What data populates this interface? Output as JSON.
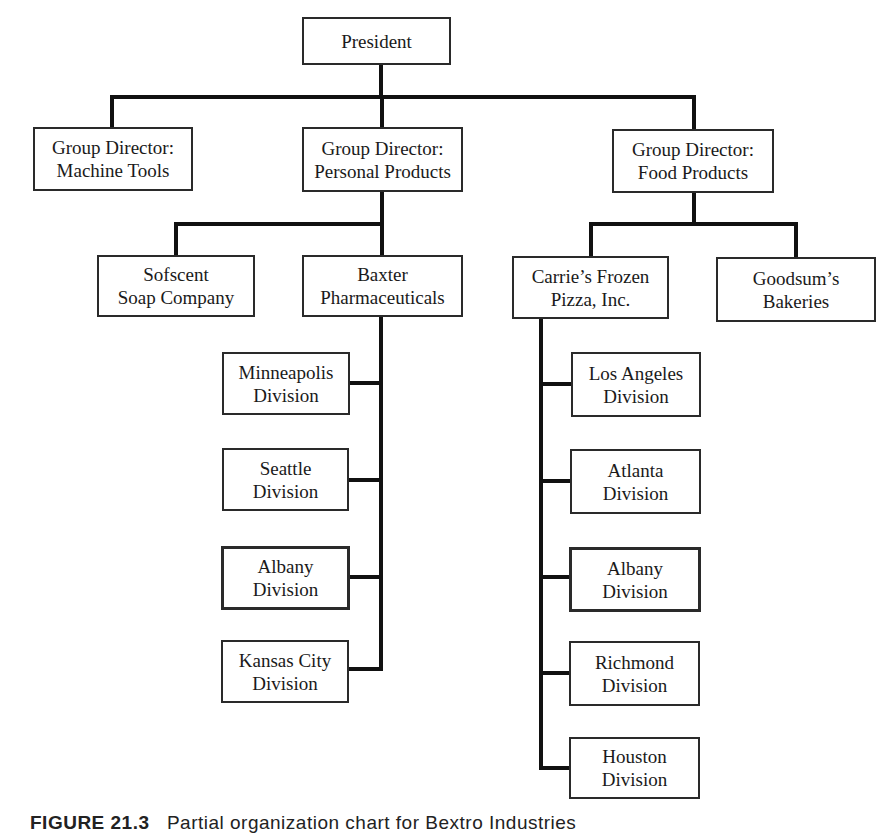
{
  "diagram": {
    "type": "organization-chart",
    "nodes": {
      "president": "President",
      "machine_tools": "Group Director:\nMachine Tools",
      "personal_products": "Group Director:\nPersonal Products",
      "food_products": "Group Director:\nFood Products",
      "sofscent": "Sofscent\nSoap Company",
      "baxter": "Baxter\nPharmaceuticals",
      "carries": "Carrie’s Frozen\nPizza, Inc.",
      "goodsums": "Goodsum’s\nBakeries",
      "baxter_divisions": [
        {
          "label": "Minneapolis\nDivision",
          "highlight": false
        },
        {
          "label": "Seattle\nDivision",
          "highlight": false
        },
        {
          "label": "Albany\nDivision",
          "highlight": true
        },
        {
          "label": "Kansas City\nDivision",
          "highlight": false
        }
      ],
      "carries_divisions": [
        {
          "label": "Los Angeles\nDivision",
          "highlight": false
        },
        {
          "label": "Atlanta\nDivision",
          "highlight": false
        },
        {
          "label": "Albany\nDivision",
          "highlight": true
        },
        {
          "label": "Richmond\nDivision",
          "highlight": false
        },
        {
          "label": "Houston\nDivision",
          "highlight": false
        }
      ]
    },
    "hierarchy": {
      "President": [
        "Group Director: Machine Tools",
        "Group Director: Personal Products",
        "Group Director: Food Products"
      ],
      "Group Director: Personal Products": [
        "Sofscent Soap Company",
        "Baxter Pharmaceuticals"
      ],
      "Group Director: Food Products": [
        "Carrie’s Frozen Pizza, Inc.",
        "Goodsum’s Bakeries"
      ],
      "Baxter Pharmaceuticals": [
        "Minneapolis Division",
        "Seattle Division",
        "Albany Division",
        "Kansas City Division"
      ],
      "Carrie’s Frozen Pizza, Inc.": [
        "Los Angeles Division",
        "Atlanta Division",
        "Albany Division",
        "Richmond Division",
        "Houston Division"
      ]
    },
    "caption": {
      "label": "FIGURE 21.3",
      "text": "Partial organization chart for Bextro Industries"
    }
  }
}
